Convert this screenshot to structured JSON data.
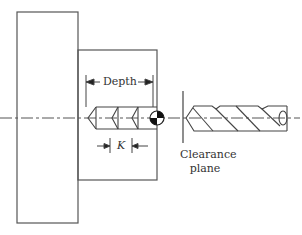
{
  "diagram": {
    "type": "machining-drilling-cycle",
    "labels": {
      "depth": "Depth",
      "k": "K",
      "clearance_line1": "Clearance",
      "clearance_line2": "plane"
    },
    "elements": [
      "fixture-block",
      "workpiece",
      "centerline",
      "peck-drill-hole-profile",
      "program-zero-marker",
      "clearance-plane-line",
      "twist-drill"
    ],
    "colors": {
      "stroke": "#555555",
      "text": "#333333",
      "background": "#ffffff",
      "marker_fill": "#111111"
    },
    "peck_count": 3
  }
}
